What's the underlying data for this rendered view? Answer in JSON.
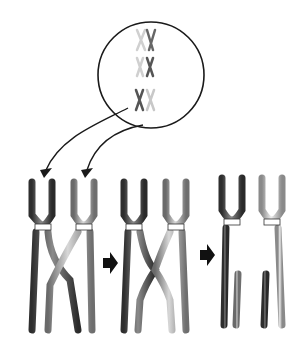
{
  "diagram": {
    "zoom_circle": {
      "label": "Tetrad pairs in nucleus",
      "pairs": 3
    },
    "stages": [
      {
        "id": "synapsis",
        "label": "Homologous chromosomes pair"
      },
      {
        "id": "crossover",
        "label": "Chromatids cross over"
      },
      {
        "id": "exchange",
        "label": "Segments exchanged"
      }
    ],
    "colors": {
      "dark_chromosome": "#4a4a4a",
      "light_chromosome": "#9a9a9a",
      "lightest_chromosome": "#c8c8c8",
      "outline": "#1a1a1a",
      "arrow": "#111111"
    }
  }
}
